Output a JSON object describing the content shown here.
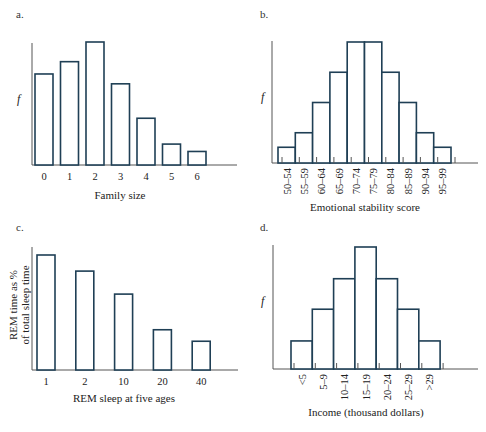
{
  "chart_data": [
    {
      "panel": "a.",
      "type": "bar",
      "title": "",
      "xlabel": "Family size",
      "ylabel": "f",
      "categories": [
        "0",
        "1",
        "2",
        "3",
        "4",
        "5",
        "6"
      ],
      "values": [
        74,
        84,
        100,
        66,
        38,
        17,
        11
      ],
      "grid": false,
      "ylim": [
        0,
        100
      ]
    },
    {
      "panel": "b.",
      "type": "bar",
      "title": "",
      "xlabel": "Emotional stability score",
      "ylabel": "f",
      "categories": [
        "50–54",
        "55–59",
        "60–64",
        "65–69",
        "70–74",
        "75–79",
        "80–84",
        "85–89",
        "90–94",
        "95–99"
      ],
      "values": [
        13,
        25,
        50,
        75,
        100,
        100,
        75,
        50,
        25,
        13
      ],
      "grid": false,
      "ylim": [
        0,
        100
      ]
    },
    {
      "panel": "c.",
      "type": "bar",
      "title": "",
      "xlabel": "REM sleep at five ages",
      "ylabel": "REM time as % of total sleep time",
      "ylabel_lines": [
        "REM time as %",
        "of total sleep time"
      ],
      "categories": [
        "1",
        "2",
        "10",
        "20",
        "40"
      ],
      "values": [
        100,
        86,
        66,
        35,
        25
      ],
      "grid": false,
      "ylim": [
        0,
        100
      ]
    },
    {
      "panel": "d.",
      "type": "bar",
      "title": "",
      "xlabel": "Income (thousand dollars)",
      "ylabel": "f",
      "categories": [
        "<5",
        "5–9",
        "10–14",
        "15–19",
        "20–24",
        "25–29",
        ">29"
      ],
      "values": [
        23,
        49,
        74,
        100,
        74,
        49,
        23
      ],
      "grid": false,
      "ylim": [
        0,
        100
      ]
    }
  ]
}
